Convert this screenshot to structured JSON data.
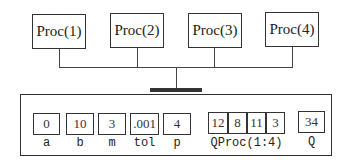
{
  "processors": [
    {
      "label": "Proc(1)"
    },
    {
      "label": "Proc(2)"
    },
    {
      "label": "Proc(3)"
    },
    {
      "label": "Proc(4)"
    }
  ],
  "shared_memory": {
    "variables": [
      {
        "name": "a",
        "values": [
          "0"
        ]
      },
      {
        "name": "b",
        "values": [
          "10"
        ]
      },
      {
        "name": "m",
        "values": [
          "3"
        ]
      },
      {
        "name": "tol",
        "values": [
          ".001"
        ]
      },
      {
        "name": "p",
        "values": [
          "4"
        ]
      },
      {
        "name": "QProc(1:4)",
        "values": [
          "12",
          "8",
          "11",
          "3"
        ]
      },
      {
        "name": "Q",
        "values": [
          "34"
        ]
      }
    ]
  }
}
